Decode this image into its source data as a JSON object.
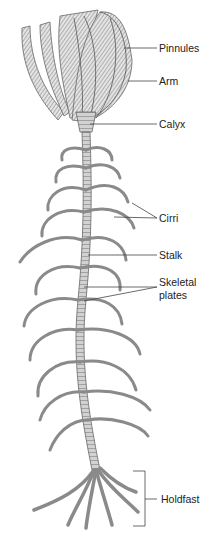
{
  "figure": {
    "labels": {
      "pinnules": "Pinnules",
      "arm": "Arm",
      "calyx": "Calyx",
      "cirri": "Cirri",
      "stalk": "Stalk",
      "skeletal_plates_line1": "Skeletal",
      "skeletal_plates_line2": "plates",
      "holdfast": "Holdfast"
    },
    "colors": {
      "line": "#444444",
      "stroke": "#6a6a6a",
      "fill": "#cfcfcf",
      "text": "#222222"
    }
  }
}
